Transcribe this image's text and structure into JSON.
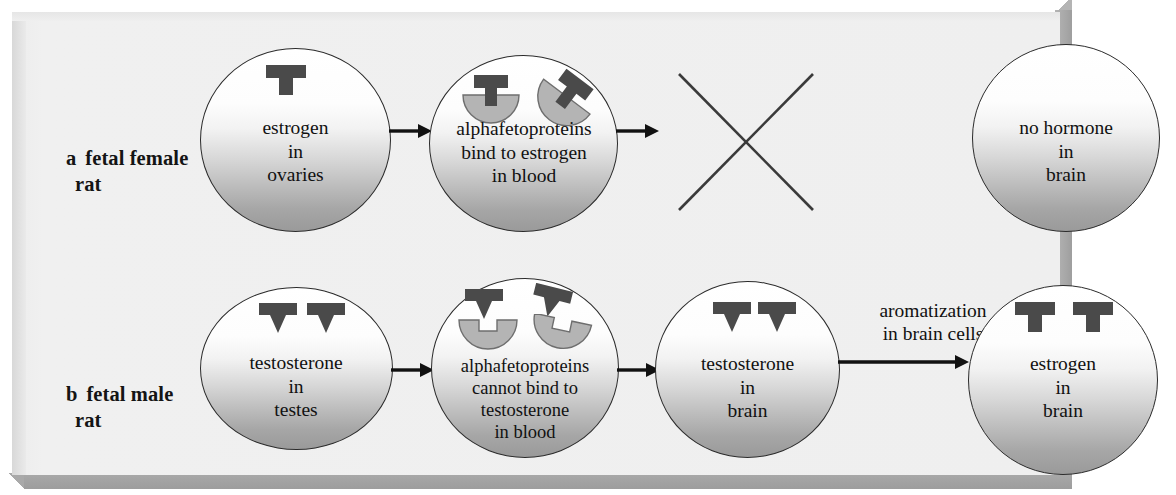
{
  "figure": {
    "colors": {
      "panel_background": "#efefef",
      "panel_shadow": "#a9a9a9",
      "circle_outline": "#2b2b2b",
      "hormone_dark": "#4a4a4a",
      "protein_gray": "#b0b0b0",
      "text": "#111111"
    }
  },
  "rows": [
    {
      "id": "a",
      "letter": "a",
      "label_line1": "fetal female",
      "label_line2": "rat",
      "steps": [
        {
          "id": "a1",
          "text_lines": [
            "estrogen",
            "in",
            "ovaries"
          ],
          "molecules": [
            {
              "type": "estrogen-t-shape",
              "count": 1
            }
          ]
        },
        {
          "id": "a2",
          "text_lines": [
            "alphafetoproteins",
            "bind to estrogen",
            "in blood"
          ],
          "molecules": [
            {
              "type": "alphafetoprotein-bound-estrogen",
              "count": 2
            }
          ]
        },
        {
          "id": "a3",
          "text_lines": [],
          "marker": "x-blocked",
          "meaning": "estrogen does not reach the brain"
        },
        {
          "id": "a4",
          "text_lines": [
            "no hormone",
            "in",
            "brain"
          ],
          "molecules": []
        }
      ],
      "arrows": [
        {
          "from": "a1",
          "to": "a2",
          "label": ""
        },
        {
          "from": "a2",
          "to": "a3",
          "label": ""
        }
      ]
    },
    {
      "id": "b",
      "letter": "b",
      "label_line1": "fetal male",
      "label_line2": "rat",
      "steps": [
        {
          "id": "b1",
          "text_lines": [
            "testosterone",
            "in",
            "testes"
          ],
          "molecules": [
            {
              "type": "testosterone-chevron-shape",
              "count": 2
            }
          ]
        },
        {
          "id": "b2",
          "text_lines": [
            "alphafetoproteins",
            "cannot bind to",
            "testosterone",
            "in blood"
          ],
          "molecules": [
            {
              "type": "alphafetoprotein-unbound",
              "count": 2
            },
            {
              "type": "testosterone-chevron-shape",
              "count": 2
            }
          ]
        },
        {
          "id": "b3",
          "text_lines": [
            "testosterone",
            "in",
            "brain"
          ],
          "molecules": [
            {
              "type": "testosterone-chevron-shape",
              "count": 2
            }
          ]
        },
        {
          "id": "b4",
          "text_lines": [
            "estrogen",
            "in",
            "brain"
          ],
          "molecules": [
            {
              "type": "estrogen-t-shape",
              "count": 2
            }
          ]
        }
      ],
      "arrows": [
        {
          "from": "b1",
          "to": "b2",
          "label": ""
        },
        {
          "from": "b2",
          "to": "b3",
          "label": ""
        },
        {
          "from": "b3",
          "to": "b4",
          "label_line1": "aromatization",
          "label_line2": "in brain cells"
        }
      ]
    }
  ],
  "captions": {
    "aromatization_line1": "aromatization",
    "aromatization_line2": "in brain cells"
  }
}
